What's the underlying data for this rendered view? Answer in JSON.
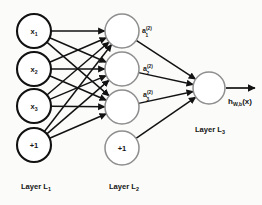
{
  "diagram": {
    "background_color": "#fbfbfa",
    "stroke_color": "#121212",
    "node_light_stroke": "#8e8e8e",
    "layers": [
      {
        "id": "L1",
        "label_text": "Layer L",
        "label_sub": "1",
        "label_x": 36,
        "label_y": 189,
        "cx": 34,
        "radius": 17,
        "style": "dark",
        "nodes": [
          {
            "id": "x1",
            "text": "x",
            "sub": "1",
            "cy": 31
          },
          {
            "id": "x2",
            "text": "x",
            "sub": "2",
            "cy": 69
          },
          {
            "id": "x3",
            "text": "x",
            "sub": "3",
            "cy": 106
          },
          {
            "id": "b1",
            "text": "+1",
            "sub": "",
            "cy": 145
          }
        ]
      },
      {
        "id": "L2",
        "label_text": "Layer L",
        "label_sub": "2",
        "label_x": 124,
        "label_y": 189,
        "cx": 122,
        "radius": 17,
        "style": "light",
        "nodes": [
          {
            "id": "h1",
            "text": "",
            "sub": "",
            "cy": 31
          },
          {
            "id": "h2",
            "text": "",
            "sub": "",
            "cy": 69
          },
          {
            "id": "h3",
            "text": "",
            "sub": "",
            "cy": 107
          },
          {
            "id": "b2",
            "text": "+1",
            "sub": "",
            "cy": 148
          }
        ]
      },
      {
        "id": "L3",
        "label_text": "Layer L",
        "label_sub": "3",
        "label_x": 210,
        "label_y": 132,
        "cx": 209,
        "radius": 16,
        "style": "light",
        "nodes": [
          {
            "id": "o1",
            "text": "",
            "sub": "",
            "cy": 88
          }
        ]
      }
    ],
    "activations": [
      {
        "id": "a1",
        "base": "a",
        "sup": "(2)",
        "sub": "1",
        "x": 147,
        "y": 33
      },
      {
        "id": "a2",
        "base": "a",
        "sup": "(2)",
        "sub": "2",
        "x": 148,
        "y": 71
      },
      {
        "id": "a3",
        "base": "a",
        "sup": "(2)",
        "sub": "3",
        "x": 148,
        "y": 97
      }
    ],
    "output": {
      "id": "hwb",
      "base": "h",
      "sub": "W,b",
      "arg": "(x)",
      "x": 228,
      "y": 104,
      "arrow_from_x": 226,
      "arrow_to_x": 255,
      "arrow_y": 88
    },
    "connections": {
      "input_to_hidden": "fully-connected",
      "hidden_to_output": "fully-connected",
      "count_input_to_hidden": 12,
      "count_hidden_to_output": 3
    }
  }
}
